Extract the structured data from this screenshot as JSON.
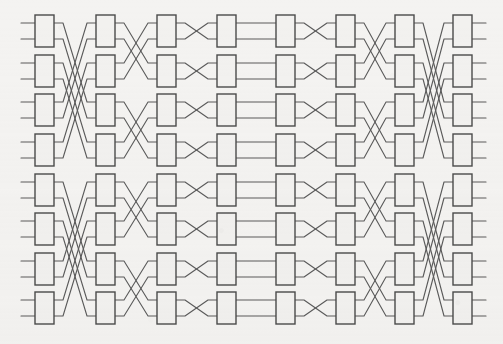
{
  "figure": {
    "type": "switching-network-diagram",
    "background_color": "#f4f3f1",
    "line_color": "#5a5a5a",
    "box_stroke_color": "#4a4a4a",
    "box_fill_color": "#f2f1ef",
    "caption": ""
  },
  "geometry": {
    "canvas_width": 503,
    "canvas_height": 344,
    "columns": 8,
    "rows": 8,
    "box_width": 19,
    "box_height": 32,
    "column_x": [
      35,
      96,
      157,
      217,
      276,
      336,
      395,
      453
    ],
    "row_y": [
      15,
      55,
      94,
      134,
      174,
      213,
      253,
      292
    ],
    "port_offset_top": 8,
    "port_offset_bottom": 24,
    "stub_length": 14,
    "line_width": 1.1,
    "box_stroke_width": 1.4
  },
  "chart_data": {
    "type": "diagram",
    "xlabel": "stage",
    "ylabel": "switch row",
    "stage_labels": [
      "1",
      "2",
      "3",
      "4",
      "5",
      "6",
      "7",
      "8"
    ],
    "row_labels": [
      "1",
      "2",
      "3",
      "4",
      "5",
      "6",
      "7",
      "8"
    ],
    "node_count": 64,
    "link_count": 128,
    "stage_patterns": [
      {
        "from_stage": 1,
        "to_stage": 2,
        "pattern": "butterfly",
        "stride": 4
      },
      {
        "from_stage": 2,
        "to_stage": 3,
        "pattern": "butterfly",
        "stride": 2
      },
      {
        "from_stage": 3,
        "to_stage": 4,
        "pattern": "butterfly",
        "stride": 1
      },
      {
        "from_stage": 4,
        "to_stage": 5,
        "pattern": "identity",
        "stride": 0
      },
      {
        "from_stage": 5,
        "to_stage": 6,
        "pattern": "butterfly",
        "stride": 1
      },
      {
        "from_stage": 6,
        "to_stage": 7,
        "pattern": "butterfly",
        "stride": 2
      },
      {
        "from_stage": 7,
        "to_stage": 8,
        "pattern": "butterfly",
        "stride": 4
      }
    ],
    "terminals_left": 16,
    "terminals_right": 16
  }
}
